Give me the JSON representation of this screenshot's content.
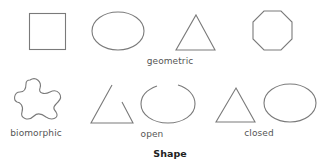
{
  "diagram": {
    "title": "Shape",
    "groups": [
      {
        "label": "geometric",
        "shapes": [
          "square",
          "ellipse",
          "triangle",
          "octagon"
        ]
      },
      {
        "label": "biomorphic",
        "shapes": [
          "biomorphic-blob"
        ]
      },
      {
        "label": "open",
        "shapes": [
          "open-triangle",
          "open-ellipse"
        ]
      },
      {
        "label": "closed",
        "shapes": [
          "closed-triangle",
          "closed-ellipse"
        ]
      }
    ],
    "colors": {
      "stroke": "#7a7a7a",
      "label": "#555555",
      "title": "#222222",
      "background": "#ffffff"
    }
  }
}
